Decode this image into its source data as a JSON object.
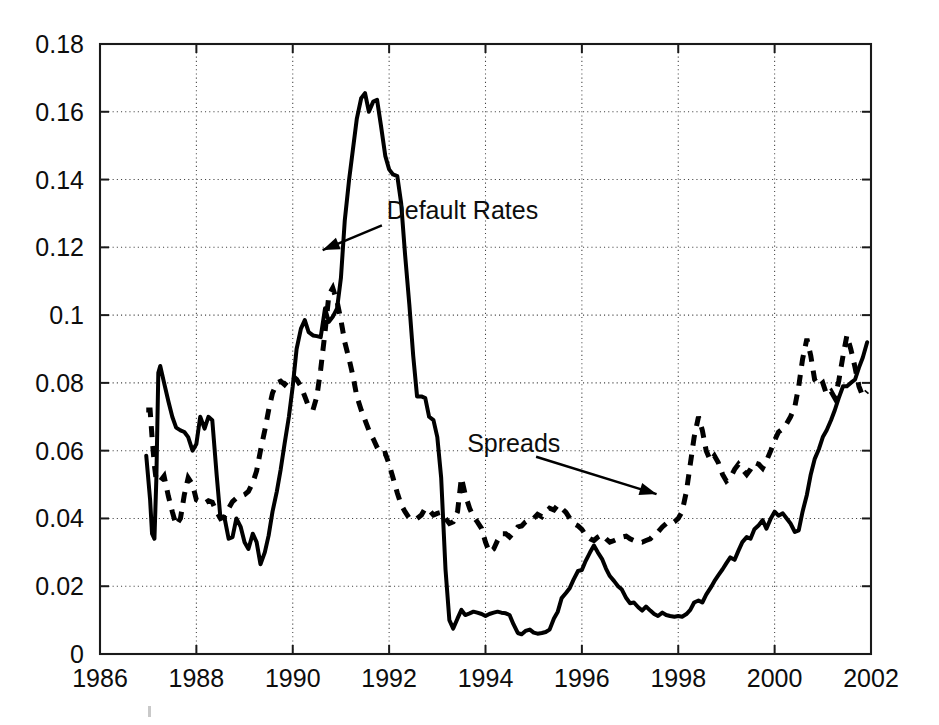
{
  "figure": {
    "background": "#ffffff",
    "ink_color": "#000000",
    "grid_color": "#444444",
    "plot_box": {
      "left": 100,
      "top": 44,
      "right": 871,
      "bottom": 654
    }
  },
  "chart_data": {
    "type": "line",
    "title": "",
    "xlabel": "",
    "ylabel": "",
    "xlim": [
      1986,
      2002
    ],
    "ylim": [
      0,
      0.18
    ],
    "grid": true,
    "legend_position": "inline-annotations",
    "xticks": [
      1986,
      1988,
      1990,
      1992,
      1994,
      1996,
      1998,
      2000,
      2002
    ],
    "xticklabels": [
      "1986",
      "1988",
      "1990",
      "1992",
      "1994",
      "1996",
      "1998",
      "2000",
      "2002"
    ],
    "yticks": [
      0,
      0.02,
      0.04,
      0.06,
      0.08,
      0.1,
      0.12,
      0.14,
      0.16,
      0.18
    ],
    "yticklabels": [
      "0",
      "0.02",
      "0.04",
      "0.06",
      "0.08",
      "0.1",
      "0.12",
      "0.14",
      "0.16",
      "0.18"
    ],
    "annotations": [
      {
        "text": "Default Rates",
        "text_x": 1991.95,
        "text_y": 0.1285,
        "arrow_from_x": 1991.85,
        "arrow_from_y": 0.1265,
        "arrow_to_x": 1990.62,
        "arrow_to_y": 0.1192
      },
      {
        "text": "Spreads",
        "text_x": 1993.62,
        "text_y": 0.0595,
        "arrow_from_x": 1995.05,
        "arrow_from_y": 0.0582,
        "arrow_to_x": 1997.55,
        "arrow_to_y": 0.0472
      }
    ],
    "series": [
      {
        "name": "Default Rates",
        "style": "solid",
        "x": [
          1986.96,
          1987.04,
          1987.08,
          1987.13,
          1987.17,
          1987.21,
          1987.25,
          1987.33,
          1987.42,
          1987.5,
          1987.58,
          1987.67,
          1987.75,
          1987.83,
          1987.92,
          1988.0,
          1988.08,
          1988.17,
          1988.25,
          1988.33,
          1988.42,
          1988.5,
          1988.58,
          1988.67,
          1988.75,
          1988.83,
          1988.92,
          1989.0,
          1989.08,
          1989.17,
          1989.25,
          1989.33,
          1989.42,
          1989.5,
          1989.58,
          1989.67,
          1989.75,
          1989.83,
          1989.92,
          1990.0,
          1990.08,
          1990.17,
          1990.25,
          1990.33,
          1990.42,
          1990.5,
          1990.58,
          1990.67,
          1990.75,
          1990.83,
          1990.92,
          1991.0,
          1991.08,
          1991.17,
          1991.25,
          1991.33,
          1991.42,
          1991.5,
          1991.58,
          1991.67,
          1991.75,
          1991.83,
          1991.92,
          1992.0,
          1992.08,
          1992.17,
          1992.25,
          1992.33,
          1992.42,
          1992.5,
          1992.58,
          1992.67,
          1992.75,
          1992.83,
          1992.92,
          1993.0,
          1993.08,
          1993.17,
          1993.25,
          1993.33,
          1993.42,
          1993.5,
          1993.58,
          1993.67,
          1993.75,
          1993.83,
          1993.92,
          1994.0,
          1994.08,
          1994.17,
          1994.25,
          1994.33,
          1994.42,
          1994.5,
          1994.58,
          1994.67,
          1994.75,
          1994.83,
          1994.92,
          1995.0,
          1995.08,
          1995.17,
          1995.25,
          1995.33,
          1995.42,
          1995.5,
          1995.58,
          1995.67,
          1995.75,
          1995.83,
          1995.92,
          1996.0,
          1996.08,
          1996.17,
          1996.25,
          1996.33,
          1996.42,
          1996.5,
          1996.58,
          1996.67,
          1996.75,
          1996.83,
          1996.92,
          1997.0,
          1997.08,
          1997.17,
          1997.25,
          1997.33,
          1997.42,
          1997.5,
          1997.58,
          1997.67,
          1997.75,
          1997.83,
          1997.92,
          1998.0,
          1998.08,
          1998.17,
          1998.25,
          1998.33,
          1998.42,
          1998.5,
          1998.58,
          1998.67,
          1998.75,
          1998.83,
          1998.92,
          1999.0,
          1999.08,
          1999.17,
          1999.25,
          1999.33,
          1999.42,
          1999.5,
          1999.58,
          1999.67,
          1999.75,
          1999.83,
          1999.92,
          2000.0,
          2000.08,
          2000.17,
          2000.25,
          2000.33,
          2000.42,
          2000.5,
          2000.58,
          2000.67,
          2000.75,
          2000.83,
          2000.92,
          2001.0,
          2001.08,
          2001.17,
          2001.25,
          2001.33,
          2001.42,
          2001.5,
          2001.58,
          2001.67,
          2001.75,
          2001.83,
          2001.92
        ],
        "y": [
          0.0585,
          0.0455,
          0.0355,
          0.034,
          0.052,
          0.083,
          0.085,
          0.08,
          0.0745,
          0.07,
          0.0668,
          0.066,
          0.0655,
          0.064,
          0.06,
          0.062,
          0.07,
          0.0665,
          0.07,
          0.069,
          0.053,
          0.04,
          0.0405,
          0.034,
          0.0345,
          0.04,
          0.0375,
          0.033,
          0.031,
          0.0355,
          0.033,
          0.0265,
          0.03,
          0.035,
          0.042,
          0.048,
          0.0545,
          0.062,
          0.07,
          0.079,
          0.09,
          0.096,
          0.0985,
          0.095,
          0.094,
          0.0938,
          0.0935,
          0.102,
          0.098,
          0.0995,
          0.102,
          0.111,
          0.128,
          0.14,
          0.149,
          0.158,
          0.164,
          0.1655,
          0.16,
          0.163,
          0.1635,
          0.156,
          0.147,
          0.143,
          0.1415,
          0.141,
          0.133,
          0.118,
          0.103,
          0.088,
          0.076,
          0.076,
          0.0755,
          0.07,
          0.069,
          0.064,
          0.052,
          0.025,
          0.01,
          0.0075,
          0.0105,
          0.013,
          0.0115,
          0.012,
          0.0125,
          0.0122,
          0.0118,
          0.0112,
          0.0118,
          0.0122,
          0.0125,
          0.0122,
          0.012,
          0.0115,
          0.0088,
          0.0062,
          0.0058,
          0.0068,
          0.0072,
          0.0063,
          0.006,
          0.0062,
          0.0065,
          0.0072,
          0.0105,
          0.0125,
          0.0165,
          0.018,
          0.0195,
          0.022,
          0.0245,
          0.0248,
          0.0275,
          0.03,
          0.032,
          0.03,
          0.028,
          0.0252,
          0.023,
          0.0215,
          0.02,
          0.019,
          0.0165,
          0.015,
          0.0152,
          0.0138,
          0.0128,
          0.014,
          0.0128,
          0.0118,
          0.0112,
          0.0122,
          0.0115,
          0.0112,
          0.011,
          0.0112,
          0.011,
          0.0118,
          0.013,
          0.0152,
          0.0158,
          0.0152,
          0.0175,
          0.0195,
          0.0215,
          0.0232,
          0.025,
          0.0268,
          0.0285,
          0.0278,
          0.0305,
          0.033,
          0.0345,
          0.034,
          0.0368,
          0.038,
          0.0395,
          0.037,
          0.04,
          0.042,
          0.0408,
          0.0415,
          0.04,
          0.0385,
          0.036,
          0.0365,
          0.042,
          0.047,
          0.053,
          0.0575,
          0.0605,
          0.064,
          0.066,
          0.069,
          0.072,
          0.0755,
          0.079,
          0.079,
          0.08,
          0.081,
          0.0845,
          0.0875,
          0.092
        ]
      },
      {
        "name": "Spreads",
        "style": "dashed",
        "x": [
          1986.96,
          1987.04,
          1987.08,
          1987.13,
          1987.17,
          1987.25,
          1987.33,
          1987.42,
          1987.5,
          1987.58,
          1987.67,
          1987.75,
          1987.83,
          1987.92,
          1988.0,
          1988.08,
          1988.17,
          1988.25,
          1988.33,
          1988.42,
          1988.5,
          1988.58,
          1988.67,
          1988.75,
          1988.83,
          1988.92,
          1989.0,
          1989.08,
          1989.17,
          1989.25,
          1989.33,
          1989.42,
          1989.5,
          1989.58,
          1989.67,
          1989.75,
          1989.83,
          1989.92,
          1990.0,
          1990.08,
          1990.17,
          1990.25,
          1990.33,
          1990.42,
          1990.5,
          1990.58,
          1990.67,
          1990.75,
          1990.83,
          1990.92,
          1991.0,
          1991.08,
          1991.17,
          1991.25,
          1991.33,
          1991.42,
          1991.5,
          1991.58,
          1991.67,
          1991.75,
          1991.83,
          1991.92,
          1992.0,
          1992.08,
          1992.17,
          1992.25,
          1992.33,
          1992.42,
          1992.5,
          1992.58,
          1992.67,
          1992.75,
          1992.83,
          1992.92,
          1993.0,
          1993.08,
          1993.17,
          1993.25,
          1993.33,
          1993.42,
          1993.5,
          1993.58,
          1993.67,
          1993.75,
          1993.83,
          1993.92,
          1994.0,
          1994.08,
          1994.17,
          1994.25,
          1994.33,
          1994.42,
          1994.5,
          1994.58,
          1994.67,
          1994.75,
          1994.83,
          1994.92,
          1995.0,
          1995.08,
          1995.17,
          1995.25,
          1995.33,
          1995.42,
          1995.5,
          1995.58,
          1995.67,
          1995.75,
          1995.83,
          1995.92,
          1996.0,
          1996.08,
          1996.17,
          1996.25,
          1996.33,
          1996.42,
          1996.5,
          1996.58,
          1996.67,
          1996.75,
          1996.83,
          1996.92,
          1997.0,
          1997.08,
          1997.17,
          1997.25,
          1997.33,
          1997.42,
          1997.5,
          1997.58,
          1997.67,
          1997.75,
          1997.83,
          1997.92,
          1998.0,
          1998.08,
          1998.17,
          1998.25,
          1998.33,
          1998.42,
          1998.5,
          1998.58,
          1998.67,
          1998.75,
          1998.83,
          1998.92,
          1999.0,
          1999.08,
          1999.17,
          1999.25,
          1999.33,
          1999.42,
          1999.5,
          1999.58,
          1999.67,
          1999.75,
          1999.83,
          1999.92,
          2000.0,
          2000.08,
          2000.17,
          2000.25,
          2000.33,
          2000.42,
          2000.5,
          2000.58,
          2000.67,
          2000.75,
          2000.83,
          2000.92,
          2001.0,
          2001.08,
          2001.17,
          2001.25,
          2001.33,
          2001.42,
          2001.5,
          2001.58,
          2001.67,
          2001.75,
          2001.83,
          2001.92
        ],
        "y": [
          0.072,
          0.072,
          0.064,
          0.0555,
          0.051,
          0.051,
          0.0525,
          0.0465,
          0.042,
          0.038,
          0.04,
          0.047,
          0.052,
          0.05,
          0.0455,
          0.045,
          0.0445,
          0.0452,
          0.0448,
          0.042,
          0.04,
          0.0405,
          0.043,
          0.045,
          0.046,
          0.0465,
          0.047,
          0.048,
          0.0505,
          0.054,
          0.06,
          0.066,
          0.072,
          0.077,
          0.08,
          0.0805,
          0.0795,
          0.081,
          0.082,
          0.081,
          0.079,
          0.076,
          0.073,
          0.072,
          0.076,
          0.084,
          0.095,
          0.106,
          0.108,
          0.104,
          0.0985,
          0.092,
          0.087,
          0.082,
          0.076,
          0.072,
          0.069,
          0.066,
          0.0635,
          0.061,
          0.059,
          0.0592,
          0.056,
          0.052,
          0.0475,
          0.044,
          0.042,
          0.04,
          0.0398,
          0.04,
          0.041,
          0.043,
          0.0425,
          0.041,
          0.0415,
          0.0418,
          0.04,
          0.0385,
          0.039,
          0.042,
          0.052,
          0.047,
          0.043,
          0.0405,
          0.039,
          0.037,
          0.033,
          0.03,
          0.031,
          0.0335,
          0.0355,
          0.0355,
          0.0345,
          0.0358,
          0.0375,
          0.0378,
          0.039,
          0.0398,
          0.04,
          0.0412,
          0.0405,
          0.0418,
          0.043,
          0.0425,
          0.044,
          0.043,
          0.0418,
          0.04,
          0.0385,
          0.0378,
          0.0368,
          0.035,
          0.034,
          0.0335,
          0.0345,
          0.0352,
          0.034,
          0.033,
          0.0335,
          0.034,
          0.0345,
          0.0348,
          0.034,
          0.0335,
          0.0332,
          0.033,
          0.0335,
          0.034,
          0.0352,
          0.036,
          0.0375,
          0.0385,
          0.0382,
          0.039,
          0.04,
          0.042,
          0.048,
          0.056,
          0.064,
          0.07,
          0.066,
          0.06,
          0.057,
          0.0585,
          0.0565,
          0.053,
          0.051,
          0.052,
          0.0545,
          0.056,
          0.0545,
          0.053,
          0.0545,
          0.0565,
          0.056,
          0.0548,
          0.057,
          0.06,
          0.063,
          0.0655,
          0.0665,
          0.068,
          0.07,
          0.073,
          0.079,
          0.087,
          0.093,
          0.088,
          0.081,
          0.079,
          0.08,
          0.0765,
          0.0775,
          0.0755,
          0.0805,
          0.088,
          0.094,
          0.09,
          0.0845,
          0.079,
          0.076,
          0.0775
        ]
      }
    ]
  }
}
